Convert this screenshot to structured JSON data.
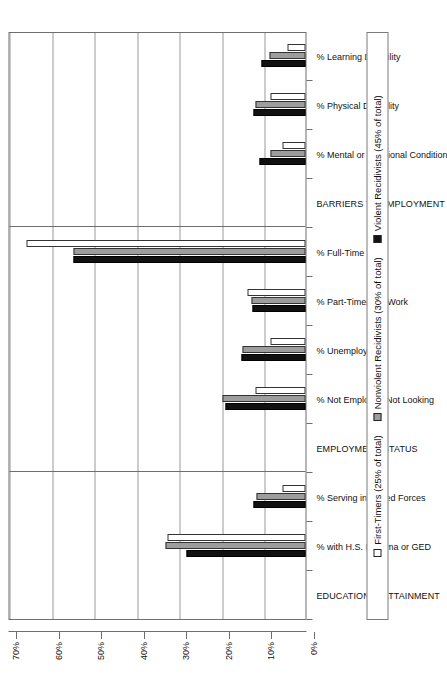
{
  "chart_data": {
    "type": "bar",
    "title": "",
    "xlabel": "",
    "ylabel": "",
    "ylim": [
      0,
      70
    ],
    "y_unit": "%",
    "grid": true,
    "orientation": "vertical-bars-rotated-90",
    "legend_position": "bottom",
    "y_ticks": [
      "0%",
      "10%",
      "20%",
      "30%",
      "40%",
      "50%",
      "60%",
      "70%"
    ],
    "y_tick_values": [
      0,
      10,
      20,
      30,
      40,
      50,
      60,
      70
    ],
    "categories": [
      "EDUCATIONAL ATTAINMENT",
      "% with H.S. Diploma or GED",
      "% Serving in Armed Forces",
      "EMPLOYMENT STATUS",
      "% Not Employed/Not Looking",
      "% Unemployed",
      "% Part-Time/Occ Work",
      "% Full-Time Work",
      "BARRIERS TO EMPLOYMENT",
      "% Mental or Emotional Condition",
      "% Physical Disability",
      "% Learning Disability"
    ],
    "section_headers": [
      "EDUCATIONAL ATTAINMENT",
      "EMPLOYMENT STATUS",
      "BARRIERS TO EMPLOYMENT"
    ],
    "series": [
      {
        "name": "Violent Recidivists (45% of total)",
        "key": "violent",
        "color": "#111111",
        "values": [
          null,
          28.0,
          12.3,
          null,
          18.8,
          15.0,
          12.5,
          54.5,
          null,
          10.8,
          12.3,
          10.3
        ]
      },
      {
        "name": "Nonviolent Recidivists (30% of total)",
        "key": "nonviolent",
        "color": "#9d9d9d",
        "values": [
          null,
          33.0,
          11.5,
          null,
          19.5,
          14.7,
          12.7,
          54.5,
          null,
          8.3,
          11.8,
          8.5
        ]
      },
      {
        "name": "First-Timers (25% of total)",
        "key": "first",
        "color": "#ffffff",
        "values": [
          null,
          32.5,
          5.5,
          null,
          11.8,
          8.3,
          13.7,
          65.5,
          null,
          5.5,
          8.3,
          4.2
        ]
      }
    ]
  },
  "legend": {
    "items": [
      {
        "label": "First-Timers (25% of total)",
        "swatch": "white-square-swatch"
      },
      {
        "label": "Nonviolent Recidivists (30% of total)",
        "swatch": "gray-square-swatch"
      },
      {
        "label": "Violent Recidivists (45% of total)",
        "swatch": "black-square-swatch"
      }
    ]
  },
  "colors": {
    "violent": "#111111",
    "nonviolent": "#9d9d9d",
    "first_timers": "#ffffff",
    "gridline": "#9a9a9a",
    "axis": "#6e6e6e",
    "background": "#ffffff"
  }
}
